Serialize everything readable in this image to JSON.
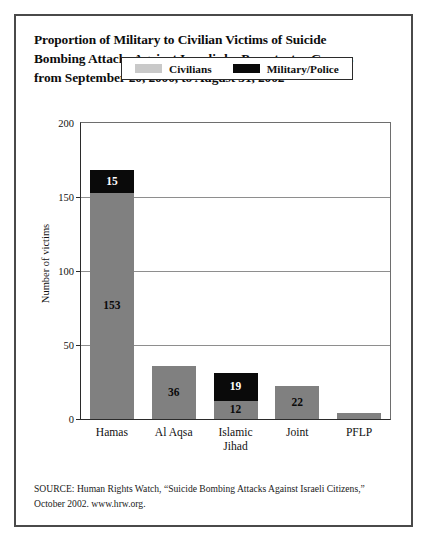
{
  "title": {
    "lines": [
      "Proportion of Military to Civilian Victims of Suicide",
      "Bombing Attacks Against Israelis by Perpetrator Groups",
      "from September 20, 2000, to August 31, 2002"
    ]
  },
  "legend": {
    "civilians_label": "Civilians",
    "military_label": "Military/Police",
    "civilians_color": "#c9c9c9",
    "military_color": "#0a0a0a"
  },
  "source": {
    "line1": "SOURCE: Human Rights Watch, “Suicide Bombing Attacks Against Israeli Citizens,”",
    "line2": "October 2002. www.hrw.org."
  },
  "chart_data": {
    "type": "bar",
    "title": "Proportion of Military to Civilian Victims of Suicide Bombing Attacks Against Israelis by Perpetrator Groups from September 20, 2000, to August 31, 2002",
    "subtitle": "",
    "xlabel": "",
    "ylabel": "Number of victims",
    "ylim": [
      0,
      200
    ],
    "yticks": [
      0,
      50,
      100,
      150,
      200
    ],
    "ytick_labels": [
      "0",
      "50",
      "100",
      "150",
      "200"
    ],
    "grid": true,
    "stacked": true,
    "legend_position": "upper-right-inside",
    "categories": [
      "Hamas",
      "Al Aqsa",
      "Islamic Jihad",
      "Joint",
      "PFLP"
    ],
    "category_label_lines": [
      [
        "Hamas"
      ],
      [
        "Al Aqsa"
      ],
      [
        "Islamic",
        "Jihad"
      ],
      [
        "Joint"
      ],
      [
        "PFLP"
      ]
    ],
    "series": [
      {
        "name": "Civilians",
        "color": "#808080",
        "values": [
          153,
          36,
          12,
          22,
          4
        ],
        "labels": [
          "153",
          "36",
          "12",
          "22",
          ""
        ]
      },
      {
        "name": "Military/Police",
        "color": "#0a0a0a",
        "values": [
          15,
          0,
          19,
          0,
          0
        ],
        "labels": [
          "15",
          "",
          "19",
          "",
          ""
        ]
      }
    ],
    "totals": [
      168,
      36,
      31,
      22,
      4
    ]
  }
}
